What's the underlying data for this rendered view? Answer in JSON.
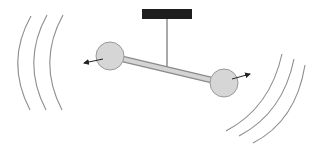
{
  "diagram": {
    "colors": {
      "background": "#ffffff",
      "mount": "#1e1e1e",
      "string": "#555555",
      "rod_fill": "#d4d4d4",
      "rod_stroke": "#8a8a8a",
      "ball_fill": "#d6d6d6",
      "ball_stroke": "#9a9a9a",
      "arrow": "#222222",
      "wave": "#8c8c8c"
    },
    "mount": {
      "x": 142,
      "y": 9,
      "width": 50,
      "height": 10
    },
    "string": {
      "x1": 167,
      "y1": 19,
      "x2": 167,
      "y2": 70
    },
    "rod": {
      "x1": 110,
      "y1": 56,
      "x2": 224,
      "y2": 83,
      "thickness": 5
    },
    "balls": [
      {
        "name": "left-ball",
        "cx": 110,
        "cy": 56,
        "r": 14
      },
      {
        "name": "right-ball",
        "cx": 224,
        "cy": 83,
        "r": 14
      }
    ],
    "arrows": [
      {
        "name": "left-velocity-arrow",
        "x1": 103,
        "y1": 59,
        "x2": 84,
        "y2": 63
      },
      {
        "name": "right-velocity-arrow",
        "x1": 232,
        "y1": 79,
        "x2": 250,
        "y2": 74
      }
    ],
    "waves_left": [
      {
        "d": "M31 16 Q5 62 30 110"
      },
      {
        "d": "M47 15 Q21 62 46 110"
      },
      {
        "d": "M63 15 Q37 62 62 110"
      }
    ],
    "waves_right": [
      {
        "d": "M282 54 Q270 108 226 131"
      },
      {
        "d": "M294 59 Q283 113 239 136"
      },
      {
        "d": "M305 65 Q296 121 253 143"
      }
    ]
  }
}
